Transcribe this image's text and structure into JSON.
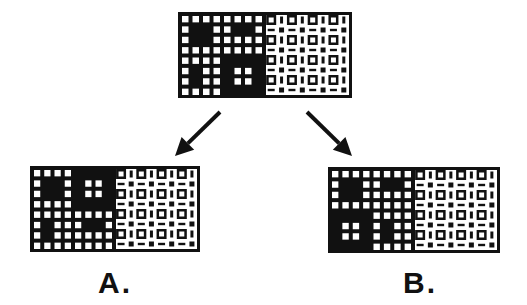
{
  "figure": {
    "colors": {
      "ink": "#111111",
      "paper": "#ffffff"
    },
    "stimuli": [
      {
        "id": "top",
        "label": "",
        "box": {
          "x": 178,
          "y": 12,
          "w": 174,
          "h": 86
        },
        "left_grid": [
          "WWWWWWWW",
          "WBBWWBBW",
          "WBBWWWWW",
          "WWWWWWWW",
          "WWWWBBBB",
          "WBWWBWWB",
          "WBWWBWWB",
          "WWWWBBBB"
        ],
        "right_texture": "square-dot-pattern"
      },
      {
        "id": "A",
        "label": "A.",
        "box": {
          "x": 30,
          "y": 166,
          "w": 170,
          "h": 86
        },
        "left_grid": [
          "WWWWBBBB",
          "WBBWBWWB",
          "WBBWBWWB",
          "WWWWBBBB",
          "WWWWWWWW",
          "WBWWWBBW",
          "WBWWWWWW",
          "WWWWWWWW"
        ],
        "right_texture": "square-dot-pattern"
      },
      {
        "id": "B",
        "label": "B.",
        "box": {
          "x": 328,
          "y": 167,
          "w": 172,
          "h": 86
        },
        "left_grid": [
          "WWWWWWWW",
          "WBBWWBBW",
          "WBBWWWWW",
          "WWWWWWWW",
          "BBBBWWWW",
          "BWWBWBWW",
          "BWWBWBWW",
          "BBBBWWWW"
        ],
        "right_texture": "square-dot-pattern"
      }
    ],
    "arrows": [
      {
        "id": "to-A",
        "from": [
          220,
          112
        ],
        "to": [
          175,
          156
        ]
      },
      {
        "id": "to-B",
        "from": [
          307,
          112
        ],
        "to": [
          352,
          156
        ]
      }
    ],
    "labels": {
      "A": {
        "text": "A.",
        "x": 98,
        "y": 268
      },
      "B": {
        "text": "B.",
        "x": 403,
        "y": 268
      }
    }
  }
}
